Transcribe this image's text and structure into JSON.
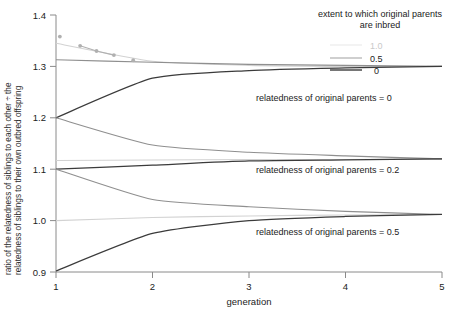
{
  "chart_data": {
    "type": "line",
    "title": "",
    "xlabel": "generation",
    "ylabel_line1": "ratio of the relatedness of siblings to each other ÷ the",
    "ylabel_line2": "relatedness of siblings to their own outbred offspring",
    "x": [
      1,
      2,
      3,
      4,
      5
    ],
    "xlim": [
      1,
      5
    ],
    "ylim": [
      0.9,
      1.4
    ],
    "xticks": [
      "1",
      "2",
      "3",
      "4",
      "5"
    ],
    "yticks": [
      "1.4",
      "1.3",
      "1.2",
      "1.1",
      "1.0",
      "0.9"
    ],
    "ytick_values": [
      1.4,
      1.3,
      1.2,
      1.1,
      1.0,
      0.9
    ],
    "grid": false,
    "legend_position": "top-right",
    "legend_title_line1": "extent to which original parents",
    "legend_title_line2": "are inbred",
    "series": [
      {
        "name": "F = 1.0, relatedness of original parents = 0",
        "group": "relatedness of original parents = 0",
        "inbreeding": "1.0",
        "color": "#c9c9c9",
        "style": "light",
        "values": [
          1.345,
          1.31,
          1.302,
          1.3,
          1.3
        ]
      },
      {
        "name": "F = 0.5, relatedness of original parents = 0",
        "group": "relatedness of original parents = 0",
        "inbreeding": "0.5",
        "color": "#8f8f8f",
        "style": "mid",
        "values": [
          1.313,
          1.308,
          1.304,
          1.302,
          1.3
        ]
      },
      {
        "name": "F = 0, relatedness of original parents = 0",
        "group": "relatedness of original parents = 0",
        "inbreeding": "0",
        "color": "#3b3b3b",
        "style": "dark",
        "values": [
          1.2,
          1.277,
          1.292,
          1.297,
          1.3
        ]
      },
      {
        "name": "F = 1.0, relatedness of original parents = 0.2",
        "group": "relatedness of original parents = 0.2",
        "inbreeding": "1.0",
        "color": "#c9c9c9",
        "style": "light",
        "values": [
          1.117,
          1.118,
          1.119,
          1.119,
          1.12
        ]
      },
      {
        "name": "F = 0.5, relatedness of original parents = 0.2",
        "group": "relatedness of original parents = 0.2",
        "inbreeding": "0.5",
        "color": "#8f8f8f",
        "style": "mid",
        "values": [
          1.2,
          1.147,
          1.133,
          1.126,
          1.12
        ]
      },
      {
        "name": "F = 0, relatedness of original parents = 0.2",
        "group": "relatedness of original parents = 0.2",
        "inbreeding": "0",
        "color": "#3b3b3b",
        "style": "dark",
        "values": [
          1.1,
          1.108,
          1.116,
          1.118,
          1.12
        ]
      },
      {
        "name": "F = 1.0, relatedness of original parents = 0.5",
        "group": "relatedness of original parents = 0.5",
        "inbreeding": "1.0",
        "color": "#c9c9c9",
        "style": "light",
        "values": [
          1.0,
          1.006,
          1.009,
          1.011,
          1.012
        ]
      },
      {
        "name": "F = 0.5, relatedness of original parents = 0.5",
        "group": "relatedness of original parents = 0.5",
        "inbreeding": "0.5",
        "color": "#8f8f8f",
        "style": "mid",
        "values": [
          1.1,
          1.041,
          1.027,
          1.018,
          1.012
        ]
      },
      {
        "name": "F = 0, relatedness of original parents = 0.5",
        "group": "relatedness of original parents = 0.5",
        "inbreeding": "0",
        "color": "#3b3b3b",
        "style": "dark",
        "values": [
          0.902,
          0.975,
          1.0,
          1.008,
          1.012
        ]
      }
    ],
    "faint_marker_series": {
      "name": "faint degraded upper trace",
      "color": "#b0b0b0",
      "points": [
        {
          "x": 1.04,
          "y": 1.358
        },
        {
          "x": 1.25,
          "y": 1.34
        },
        {
          "x": 1.42,
          "y": 1.33
        },
        {
          "x": 1.6,
          "y": 1.322
        },
        {
          "x": 1.8,
          "y": 1.312
        }
      ]
    },
    "annotations": [
      {
        "id": "annot-0",
        "text": "relatedness of original parents = 0",
        "x": 3.05,
        "y": 1.268
      },
      {
        "id": "annot-02",
        "text": "relatedness of original parents = 0.2",
        "x": 3.05,
        "y": 1.093
      },
      {
        "id": "annot-05",
        "text": "relatedness of original parents = 0.5",
        "x": 3.05,
        "y": 0.988
      }
    ],
    "legend_entries": [
      {
        "label": "1.0",
        "style": "light",
        "color": "#ededed"
      },
      {
        "label": "0.5",
        "style": "mid",
        "color": "#b5b5b5"
      },
      {
        "label": "0",
        "style": "dark",
        "color": "#3b3b3b"
      }
    ]
  }
}
